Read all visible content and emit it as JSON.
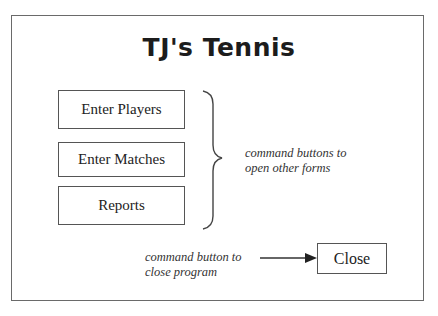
{
  "form": {
    "title": "TJ's Tennis"
  },
  "buttons": [
    {
      "label": "Enter Players"
    },
    {
      "label": "Enter Matches"
    },
    {
      "label": "Reports"
    }
  ],
  "close_button": {
    "label": "Close"
  },
  "annotations": {
    "brace_note_line1": "command buttons to",
    "brace_note_line2": "open other forms",
    "close_note_line1": "command button to",
    "close_note_line2": "close program"
  },
  "colors": {
    "border": "#555555",
    "text": "#222222",
    "background": "#ffffff"
  }
}
